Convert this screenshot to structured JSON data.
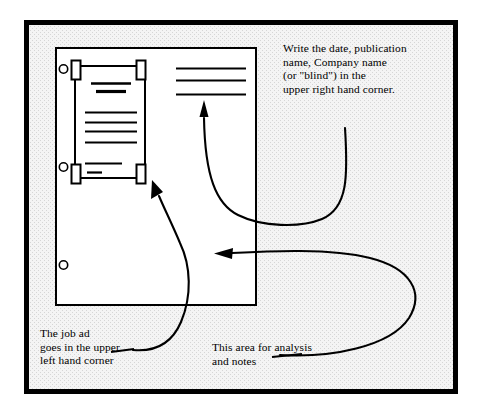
{
  "figure": {
    "colors": {
      "ink": "#000000",
      "page_fill": "#ffffff",
      "frame_background": "#f2f2f2",
      "texture_dot": "#d8d8d8"
    }
  },
  "captions": {
    "top_right": {
      "name": "write-date-publication-note",
      "lines": [
        "Write the date, publication",
        "name, Company name",
        "(or \"blind\") in the",
        "upper right hand corner."
      ],
      "text": "Write the date, publication\nname, Company name\n(or \"blind\") in the\nupper right hand corner."
    },
    "bottom_left": {
      "name": "job-ad-placement-note",
      "lines": [
        "The job ad",
        "goes in the upper",
        "left hand corner"
      ],
      "text": "The job ad\ngoes in the upper\nleft hand corner"
    },
    "bottom_center": {
      "name": "analysis-area-note",
      "lines": [
        "This area for analysis",
        "and notes"
      ],
      "text": "This area for analysis\nand notes"
    }
  },
  "page_sheet": {
    "name": "filing-sheet",
    "hole_punches": 3,
    "clipping": {
      "name": "job-ad-clipping",
      "tape_marks": 4,
      "headline_rules": 2,
      "body_rules": 4,
      "footer_rules": 2
    },
    "header_rules": {
      "name": "upper-right-header-lines",
      "count": 3
    }
  },
  "arrows": [
    {
      "name": "arrow-to-upper-right-corner",
      "points_to": "upper right hand corner of sheet"
    },
    {
      "name": "arrow-to-analysis-area",
      "points_to": "blank analysis area of sheet"
    },
    {
      "name": "arrow-to-job-ad",
      "points_to": "job ad clipping"
    }
  ]
}
